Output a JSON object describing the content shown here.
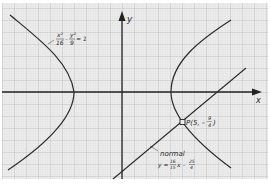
{
  "diagram": {
    "type": "hyperbola-with-normal",
    "axes": {
      "x_label": "x",
      "y_label": "y"
    },
    "hyperbola": {
      "equation_label": {
        "term1_num": "x²",
        "term1_den": "16",
        "minus": "–",
        "term2_num": "y²",
        "term2_den": "9",
        "equals": "= 1"
      }
    },
    "point": {
      "label_prefix": "P(5, –",
      "frac_num": "9",
      "frac_den": "4",
      "label_suffix": ")"
    },
    "normal": {
      "label": "normal",
      "eq_prefix": "y = ",
      "frac1_num": "16",
      "frac1_den": "15",
      "mid": "x – ",
      "frac2_num": "25",
      "frac2_den": "4"
    },
    "colors": {
      "paper": "#ececec",
      "grid_minor": "#cfcfcf",
      "grid_major": "#a9a9a9",
      "curve": "#2b2b2b"
    }
  }
}
